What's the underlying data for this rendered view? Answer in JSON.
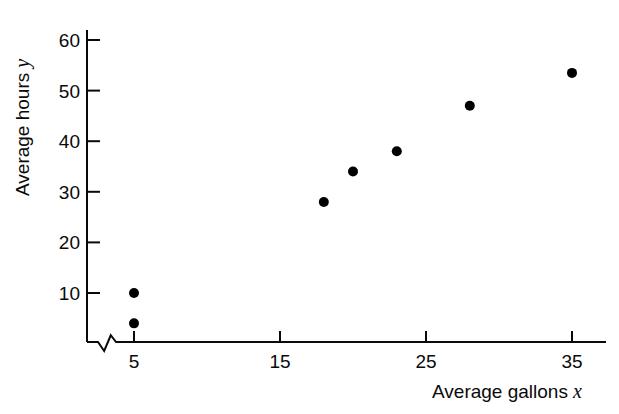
{
  "chart_data": {
    "type": "scatter",
    "title": "",
    "xlabel": "Average gallons",
    "xlabel_var": "x",
    "ylabel": "Average hours",
    "ylabel_var": "y",
    "xlim": [
      2,
      37
    ],
    "ylim": [
      0,
      62
    ],
    "grid": false,
    "legend": null,
    "axis_break": {
      "axis": "x",
      "style": "zigzag",
      "note": "break near origin on horizontal axis"
    },
    "xticks": [
      5,
      15,
      25,
      35
    ],
    "xtick_labels": [
      "5",
      "15",
      "25",
      "35"
    ],
    "yticks": [
      10,
      20,
      30,
      40,
      50,
      60
    ],
    "ytick_labels": [
      "10",
      "20",
      "30",
      "40",
      "50",
      "60"
    ],
    "marker": {
      "shape": "circle",
      "filled": true,
      "color": "#000000",
      "size": 9
    },
    "points": [
      {
        "x": 5,
        "y": 4
      },
      {
        "x": 5,
        "y": 10
      },
      {
        "x": 18,
        "y": 28
      },
      {
        "x": 20,
        "y": 34
      },
      {
        "x": 23,
        "y": 38
      },
      {
        "x": 28,
        "y": 47
      },
      {
        "x": 35,
        "y": 53.5
      }
    ]
  },
  "colors": {
    "axis": "#0a0a0a",
    "marker": "#000000",
    "background": "#ffffff",
    "text": "#0a0a0a"
  }
}
